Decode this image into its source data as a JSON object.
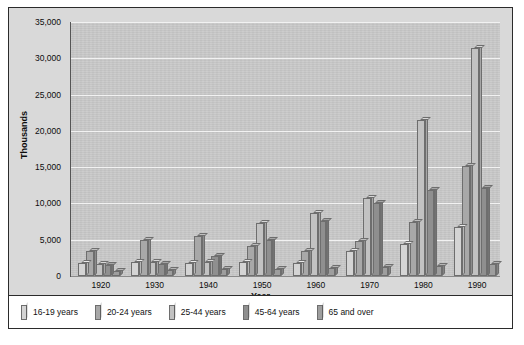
{
  "chart_data": {
    "type": "bar",
    "title": "",
    "xlabel": "Year",
    "ylabel": "Thousands",
    "ylim": [
      0,
      35000
    ],
    "ytick_values": [
      0,
      5000,
      10000,
      15000,
      20000,
      25000,
      30000,
      35000
    ],
    "ytick_labels": [
      "0",
      "5,000",
      "10,000",
      "15,000",
      "20,000",
      "25,000",
      "30,000",
      "35,000"
    ],
    "grid": true,
    "legend_position": "bottom",
    "categories": [
      "1920",
      "1930",
      "1940",
      "1950",
      "1960",
      "1970",
      "1980",
      "1990"
    ],
    "series": [
      {
        "name": "16-19 years",
        "color": "#d4d4d4",
        "values": [
          1800,
          1900,
          1800,
          1900,
          1800,
          3400,
          4400,
          6700
        ]
      },
      {
        "name": "20-24 years",
        "color": "#a8a8a8",
        "values": [
          3400,
          4900,
          5500,
          4100,
          3500,
          4800,
          7400,
          15200
        ]
      },
      {
        "name": "25-44 years",
        "color": "#c2c2c2",
        "values": [
          1600,
          1900,
          2000,
          7300,
          8700,
          10700,
          21500,
          31400
        ]
      },
      {
        "name": "45-64 years",
        "color": "#8f8f8f",
        "values": [
          1500,
          1700,
          2700,
          4900,
          7600,
          10000,
          11900,
          12100
        ]
      },
      {
        "name": "65 and over",
        "color": "#9e9e9e",
        "values": [
          700,
          800,
          900,
          1000,
          1100,
          1300,
          1400,
          1700
        ]
      }
    ]
  },
  "legend": {
    "items": [
      {
        "label": "16-19 years"
      },
      {
        "label": "20-24 years"
      },
      {
        "label": "25-44 years"
      },
      {
        "label": "45-64 years"
      },
      {
        "label": "65 and over"
      }
    ]
  },
  "colors": {
    "frame_border": "#2b2b2b",
    "outer_background": "#d9d9d9",
    "plot_background": "#c9c9c9",
    "gridline": "#f2f2f2",
    "legend_background": "#ffffff",
    "text": "#0c0c0c"
  }
}
